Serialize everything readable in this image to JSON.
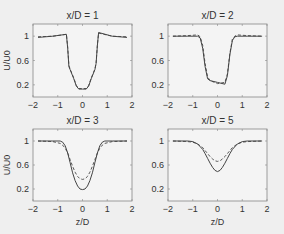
{
  "chart_data": [
    {
      "type": "line",
      "title": "x/D = 1",
      "xlabel": "",
      "ylabel": "U/U0",
      "xlim": [
        -2,
        2
      ],
      "ylim": [
        0,
        1.2
      ],
      "xticks": [
        -2,
        -1,
        0,
        1,
        2
      ],
      "yticks": [
        0.2,
        0.6,
        1
      ],
      "grid": false,
      "series": [
        {
          "name": "solid",
          "style": "solid",
          "x": [
            -1.8,
            -1.2,
            -0.65,
            -0.6,
            -0.55,
            -0.5,
            -0.35,
            -0.25,
            -0.15,
            0,
            0.15,
            0.25,
            0.35,
            0.5,
            0.55,
            0.6,
            0.65,
            1.2,
            1.8
          ],
          "y": [
            0.98,
            1.0,
            1.03,
            0.8,
            0.5,
            0.45,
            0.3,
            0.18,
            0.13,
            0.13,
            0.13,
            0.18,
            0.3,
            0.45,
            0.55,
            0.85,
            1.06,
            1.0,
            0.98
          ]
        },
        {
          "name": "dashed",
          "style": "dashed",
          "x": [
            -1.8,
            -1.2,
            -0.65,
            -0.6,
            -0.55,
            -0.5,
            -0.35,
            -0.25,
            -0.15,
            0,
            0.15,
            0.25,
            0.35,
            0.5,
            0.55,
            0.6,
            0.65,
            1.2,
            1.8
          ],
          "y": [
            0.99,
            1.0,
            1.03,
            0.82,
            0.52,
            0.46,
            0.31,
            0.19,
            0.14,
            0.14,
            0.14,
            0.19,
            0.31,
            0.46,
            0.56,
            0.86,
            1.05,
            1.0,
            0.99
          ]
        }
      ]
    },
    {
      "type": "line",
      "title": "x/D = 2",
      "xlabel": "",
      "ylabel": "",
      "xlim": [
        -2,
        2
      ],
      "ylim": [
        0,
        1.2
      ],
      "xticks": [
        -2,
        -1,
        0,
        1,
        2
      ],
      "yticks": [
        0.2,
        0.6,
        1
      ],
      "grid": false,
      "series": [
        {
          "name": "solid",
          "style": "solid",
          "x": [
            -1.8,
            -1.2,
            -0.8,
            -0.7,
            -0.6,
            -0.5,
            -0.4,
            -0.3,
            0,
            0.3,
            0.4,
            0.5,
            0.6,
            0.7,
            0.8,
            1.2,
            1.8
          ],
          "y": [
            1.0,
            1.0,
            1.0,
            0.97,
            0.8,
            0.5,
            0.3,
            0.27,
            0.24,
            0.21,
            0.35,
            0.7,
            0.93,
            0.99,
            1.0,
            1.0,
            1.0
          ]
        },
        {
          "name": "dashed",
          "style": "dashed",
          "x": [
            -1.8,
            -1.2,
            -0.8,
            -0.7,
            -0.6,
            -0.5,
            -0.4,
            -0.3,
            0,
            0.3,
            0.4,
            0.5,
            0.6,
            0.7,
            0.8,
            1.2,
            1.8
          ],
          "y": [
            1.0,
            1.01,
            1.02,
            0.99,
            0.85,
            0.55,
            0.33,
            0.27,
            0.22,
            0.24,
            0.38,
            0.72,
            0.95,
            1.0,
            1.02,
            1.01,
            1.0
          ]
        }
      ]
    },
    {
      "type": "line",
      "title": "x/D = 3",
      "xlabel": "z/D",
      "ylabel": "U/U0",
      "xlim": [
        -2,
        2
      ],
      "ylim": [
        0,
        1.2
      ],
      "xticks": [
        -2,
        -1,
        0,
        1,
        2
      ],
      "yticks": [
        0.2,
        0.6,
        1
      ],
      "grid": false,
      "series": [
        {
          "name": "solid",
          "style": "solid",
          "x": [
            -1.8,
            -1.2,
            -0.9,
            -0.8,
            -0.7,
            -0.6,
            -0.5,
            -0.4,
            -0.3,
            -0.2,
            -0.1,
            0,
            0.1,
            0.2,
            0.3,
            0.4,
            0.5,
            0.6,
            0.7,
            0.8,
            0.9,
            1.2,
            1.8
          ],
          "y": [
            1.0,
            1.0,
            1.0,
            0.98,
            0.92,
            0.8,
            0.64,
            0.47,
            0.34,
            0.25,
            0.2,
            0.19,
            0.2,
            0.25,
            0.34,
            0.47,
            0.64,
            0.8,
            0.92,
            0.98,
            1.0,
            1.0,
            1.0
          ]
        },
        {
          "name": "dashed",
          "style": "dashed",
          "x": [
            -1.8,
            -1.2,
            -0.9,
            -0.8,
            -0.7,
            -0.6,
            -0.5,
            -0.4,
            -0.3,
            -0.2,
            -0.1,
            0,
            0.1,
            0.2,
            0.3,
            0.4,
            0.5,
            0.6,
            0.7,
            0.8,
            0.9,
            1.2,
            1.8
          ],
          "y": [
            1.0,
            0.99,
            0.96,
            0.93,
            0.88,
            0.8,
            0.69,
            0.58,
            0.48,
            0.41,
            0.37,
            0.36,
            0.37,
            0.41,
            0.48,
            0.58,
            0.69,
            0.8,
            0.88,
            0.93,
            0.96,
            0.99,
            1.0
          ]
        }
      ]
    },
    {
      "type": "line",
      "title": "x/D = 5",
      "xlabel": "z/D",
      "ylabel": "",
      "xlim": [
        -2,
        2
      ],
      "ylim": [
        0,
        1.2
      ],
      "xticks": [
        -2,
        -1,
        0,
        1,
        2
      ],
      "yticks": [
        0.2,
        0.6,
        1
      ],
      "grid": false,
      "series": [
        {
          "name": "solid",
          "style": "solid",
          "x": [
            -1.8,
            -1.2,
            -1.0,
            -0.8,
            -0.6,
            -0.5,
            -0.4,
            -0.3,
            -0.2,
            -0.1,
            0,
            0.1,
            0.2,
            0.3,
            0.4,
            0.5,
            0.6,
            0.8,
            1.0,
            1.2,
            1.8
          ],
          "y": [
            1.0,
            1.0,
            0.99,
            0.95,
            0.86,
            0.79,
            0.71,
            0.63,
            0.56,
            0.51,
            0.49,
            0.51,
            0.56,
            0.63,
            0.71,
            0.79,
            0.86,
            0.95,
            0.99,
            1.0,
            1.0
          ]
        },
        {
          "name": "dashed",
          "style": "dashed",
          "x": [
            -1.8,
            -1.2,
            -1.0,
            -0.8,
            -0.6,
            -0.5,
            -0.4,
            -0.3,
            -0.2,
            -0.1,
            0,
            0.1,
            0.2,
            0.3,
            0.4,
            0.5,
            0.6,
            0.8,
            1.0,
            1.2,
            1.8
          ],
          "y": [
            1.0,
            0.99,
            0.98,
            0.95,
            0.89,
            0.84,
            0.79,
            0.74,
            0.7,
            0.67,
            0.66,
            0.67,
            0.7,
            0.74,
            0.79,
            0.84,
            0.89,
            0.95,
            0.98,
            0.99,
            1.0
          ]
        }
      ]
    }
  ],
  "layout": {
    "panels": [
      {
        "left": 33,
        "top": 24,
        "right": 132,
        "bottom": 97
      },
      {
        "left": 168,
        "top": 24,
        "right": 267,
        "bottom": 97
      },
      {
        "left": 33,
        "top": 129,
        "right": 132,
        "bottom": 201
      },
      {
        "left": 168,
        "top": 129,
        "right": 267,
        "bottom": 201
      }
    ],
    "line_color": "#444444",
    "axis_color": "#888888"
  }
}
